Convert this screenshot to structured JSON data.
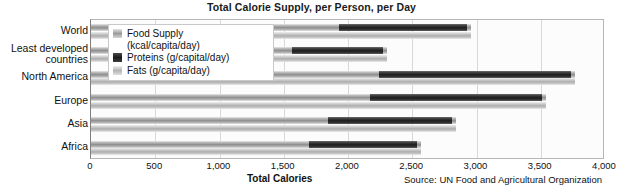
{
  "chart_data": {
    "type": "bar",
    "title": "Total Calorie Supply, per Person, per Day",
    "xlabel": "Total Calories",
    "ylabel": "",
    "orientation": "horizontal",
    "grid": true,
    "legend_position": "inside-top-left",
    "xlim": [
      0,
      4000
    ],
    "xticks": [
      0,
      500,
      1000,
      1500,
      2000,
      2500,
      3000,
      3500,
      4000
    ],
    "xtick_labels": [
      "0",
      "500",
      "1,000",
      "1,500",
      "2,000",
      "2,500",
      "3,000",
      "3,500",
      "4,000"
    ],
    "categories": [
      "World",
      "Least developed countries",
      "North America",
      "Europe",
      "Asia",
      "Africa"
    ],
    "series": [
      {
        "name": "Food Supply (kcal/capita/day)",
        "short_name": "Food Supply",
        "units": "kcal/capita/day",
        "color": "#8f8f8f",
        "values": [
          2960,
          2300,
          3770,
          3540,
          2840,
          2570
        ]
      },
      {
        "name": "Proteins (g/capital/day)",
        "short_name": "Proteins",
        "units": "g/capital/day",
        "color": "#1d1d1d",
        "values": [
          77,
          54,
          115,
          103,
          74,
          65
        ]
      },
      {
        "name": "Fats (g/capita/day)",
        "short_name": "Fats",
        "units": "g/capita/day",
        "color": "#adadad",
        "values": [
          80,
          42,
          158,
          140,
          70,
          54
        ]
      }
    ],
    "annotations": {
      "source": "Source: UN Food and Agricultural Organization"
    }
  },
  "legend": {
    "items": [
      {
        "swatch": "food",
        "line1": "Food Supply",
        "line2": "(kcal/capita/day)"
      },
      {
        "swatch": "protein",
        "line1": "Proteins (g/capital/day)",
        "line2": ""
      },
      {
        "swatch": "fat",
        "line1": "Fats (g/capita/day)",
        "line2": ""
      }
    ]
  }
}
